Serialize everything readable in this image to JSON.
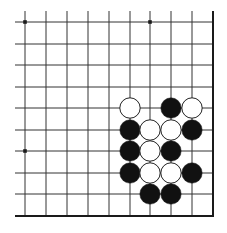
{
  "board": {
    "description": "Go board fragment (lower-right corner)",
    "grid": {
      "x_lines": [
        25,
        46,
        67,
        88,
        109,
        130,
        150,
        171,
        192
      ],
      "y_lines": [
        22,
        44,
        65,
        87,
        108,
        130,
        151,
        173,
        194
      ],
      "right_edge": 213,
      "bottom_edge": 216,
      "line_start_x": 15,
      "line_start_y": 11
    },
    "star_points": [
      {
        "col": 0,
        "row": 0
      },
      {
        "col": 6,
        "row": 0
      },
      {
        "col": 0,
        "row": 6
      }
    ],
    "stones": [
      {
        "color": "white",
        "col": 5,
        "row": 4
      },
      {
        "color": "black",
        "col": 7,
        "row": 4
      },
      {
        "color": "white",
        "col": 8,
        "row": 4
      },
      {
        "color": "black",
        "col": 5,
        "row": 5
      },
      {
        "color": "white",
        "col": 6,
        "row": 5
      },
      {
        "color": "white",
        "col": 7,
        "row": 5
      },
      {
        "color": "black",
        "col": 8,
        "row": 5
      },
      {
        "color": "black",
        "col": 5,
        "row": 6
      },
      {
        "color": "white",
        "col": 6,
        "row": 6
      },
      {
        "color": "black",
        "col": 7,
        "row": 6
      },
      {
        "color": "black",
        "col": 5,
        "row": 7
      },
      {
        "color": "white",
        "col": 6,
        "row": 7
      },
      {
        "color": "white",
        "col": 7,
        "row": 7
      },
      {
        "color": "black",
        "col": 8,
        "row": 7
      },
      {
        "color": "black",
        "col": 6,
        "row": 8
      },
      {
        "color": "black",
        "col": 7,
        "row": 8
      }
    ],
    "colors": {
      "line": "#333333",
      "edge": "#1a1a1a",
      "black_stone": "#111111",
      "white_stone": "#ffffff",
      "stone_outline": "#222222"
    }
  }
}
